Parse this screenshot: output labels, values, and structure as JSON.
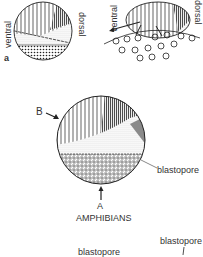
{
  "figure": {
    "panel_a": {
      "panel_label": "a",
      "sphere_labels": {
        "left": "ventral",
        "right": "dorsal"
      },
      "disc_labels": {
        "left": "ventral",
        "right": "dorsal"
      }
    },
    "panel_amphibians": {
      "label_B": "B",
      "label_A": "A",
      "blastopore_label": "blastopore",
      "caption": "AMPHIBIANS"
    },
    "panel_bottom": {
      "blastopore_label_right": "blastopore",
      "blastopore_label_left": "blastopore"
    }
  },
  "colors": {
    "ink": "#222222",
    "gray_fill": "#8a8a8a",
    "background": "#ffffff"
  }
}
